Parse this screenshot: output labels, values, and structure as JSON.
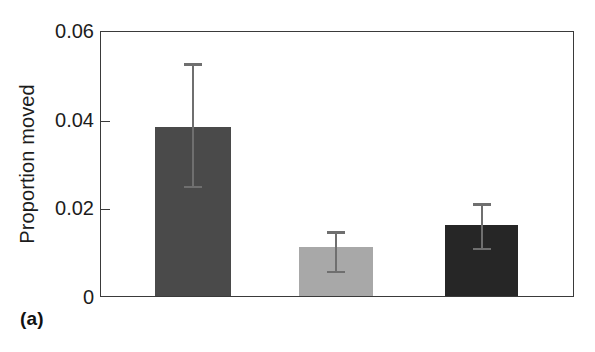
{
  "panel": {
    "label": "(a)"
  },
  "chart_data": {
    "type": "bar",
    "title": "",
    "subtitle": "",
    "xlabel": "",
    "ylabel": "Proportion moved",
    "ylim": [
      0,
      0.06
    ],
    "yticks": [
      0,
      0.02,
      0.04,
      0.06
    ],
    "ytick_labels": [
      "0",
      "0.02",
      "0.04",
      "0.06"
    ],
    "xticks": [],
    "xtick_labels": [],
    "grid": false,
    "legend": false,
    "legend_position": "none",
    "categories": [
      "bar-1",
      "bar-2",
      "bar-3"
    ],
    "values": [
      0.0381,
      0.011,
      0.016
    ],
    "error_upper": [
      0.053,
      0.0151,
      0.0214
    ],
    "error_lower": [
      0.0248,
      0.0056,
      0.0108
    ],
    "bar_colors": [
      "#4a4a4a",
      "#a8a8a8",
      "#262626"
    ],
    "errorbar_color": "#6f6f6f",
    "axis_color": "#3a3a3a",
    "background": "#ffffff",
    "bars": [
      {
        "name": "bar-1",
        "value": 0.0381,
        "error_upper": 0.053,
        "error_lower": 0.0248,
        "color": "#4a4a4a",
        "left_px": 154,
        "width_px": 76
      },
      {
        "name": "bar-2",
        "value": 0.011,
        "error_upper": 0.0151,
        "error_lower": 0.0056,
        "color": "#a8a8a8",
        "left_px": 298,
        "width_px": 74
      },
      {
        "name": "bar-3",
        "value": 0.016,
        "error_upper": 0.0214,
        "error_lower": 0.0108,
        "color": "#262626",
        "left_px": 444,
        "width_px": 73
      }
    ]
  }
}
